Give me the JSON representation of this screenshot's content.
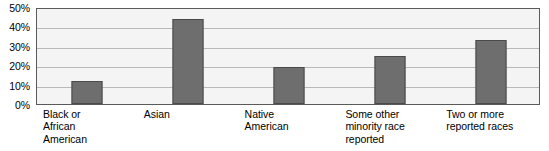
{
  "chart_data": {
    "type": "bar",
    "title": "",
    "subtitle": "",
    "xlabel": "",
    "ylabel": "",
    "ylim": [
      0,
      50
    ],
    "grid": true,
    "legend": null,
    "categories": [
      "Black or African American",
      "Asian",
      "Native American",
      "Some other minority race reported",
      "Two or more reported races"
    ],
    "category_lines": [
      [
        "Black or",
        "African",
        "American"
      ],
      [
        "Asian"
      ],
      [
        "Native",
        "American"
      ],
      [
        "Some other",
        "minority race",
        "reported"
      ],
      [
        "Two or more",
        "reported races"
      ]
    ],
    "values": [
      12,
      44,
      19,
      25,
      33
    ],
    "value_unit": "%",
    "y_ticks": [
      0,
      10,
      20,
      30,
      40,
      50
    ],
    "y_tick_labels": [
      "0%",
      "10%",
      "20%",
      "30%",
      "40%",
      "50%"
    ]
  },
  "style": {
    "bar_fill": "#6e6e6e",
    "bar_border": "#4a4a4a",
    "plot_background": "#f4f4f4",
    "plot_border": "#5a5a5a",
    "gridline_color": "#b9b9b9",
    "text_color": "#000000",
    "page_background": "#ffffff"
  }
}
